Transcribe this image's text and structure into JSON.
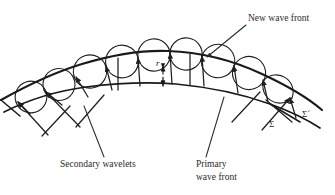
{
  "figure": {
    "type": "physics-diagram",
    "background_color": "#ffffff",
    "ink_color": "#1a1a1a",
    "text_color": "#2b2b2b"
  },
  "labels": {
    "new_wave_front": "New wave front",
    "secondary_wavelets": "Secondary wavelets",
    "primary_line1": "Primary",
    "primary_line2": "wave front",
    "radius": "r",
    "sigma": "Σ",
    "sigma_prime": "Σ´"
  },
  "diagram_data": {
    "primary_wave_front": {
      "name": "Σ",
      "description": "lower arc, primary wave front",
      "arc_points": [
        [
          6,
          110
        ],
        [
          40,
          96
        ],
        [
          80,
          88
        ],
        [
          120,
          85
        ],
        [
          165,
          84
        ],
        [
          210,
          87
        ],
        [
          250,
          94
        ],
        [
          288,
          104
        ],
        [
          318,
          116
        ]
      ]
    },
    "new_wave_front": {
      "name": "Σ´",
      "description": "upper arc, new wave front, envelope of secondary wavelets",
      "arc_points": [
        [
          2,
          98
        ],
        [
          36,
          80
        ],
        [
          76,
          66
        ],
        [
          118,
          56
        ],
        [
          162,
          51
        ],
        [
          206,
          54
        ],
        [
          248,
          64
        ],
        [
          286,
          80
        ],
        [
          318,
          98
        ]
      ]
    },
    "radius_marker": {
      "label": "r",
      "description": "dashed double arrow between primary and new wave front",
      "x": 163,
      "y_top": 68,
      "y_bottom": 85
    },
    "secondary_wavelet_centers": [
      [
        28,
        100
      ],
      [
        62,
        91
      ],
      [
        98,
        86
      ],
      [
        133,
        84
      ],
      [
        165,
        84
      ],
      [
        198,
        85
      ],
      [
        232,
        90
      ],
      [
        265,
        98
      ],
      [
        296,
        109
      ]
    ],
    "ray_count": 9,
    "wavelet_count": 9
  },
  "annotations": [
    {
      "id": "new-wave-front",
      "text": "New wave front",
      "text_x": 248,
      "text_y": 20,
      "leader_from": [
        246,
        24
      ],
      "leader_to": [
        206,
        56
      ]
    },
    {
      "id": "secondary-wavelets",
      "text": "Secondary wavelets",
      "text_x": 60,
      "text_y": 167,
      "leader_from": [
        104,
        157
      ],
      "leader_to": [
        82,
        105
      ]
    },
    {
      "id": "primary-wave-front",
      "text": "Primary wave front",
      "text_x": 196,
      "text_y": 167,
      "leader_from": [
        206,
        157
      ],
      "leader_to": [
        222,
        96
      ]
    },
    {
      "id": "sigma",
      "text": "Σ",
      "text_x": 270,
      "text_y": 126
    },
    {
      "id": "sigma-prime",
      "text": "Σ´",
      "text_x": 303,
      "text_y": 116
    }
  ]
}
